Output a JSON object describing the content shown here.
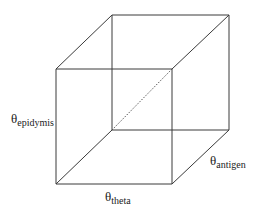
{
  "diagram": {
    "type": "cube",
    "line_color": "#3a3a3a",
    "vertices": {
      "front_top_left": [
        56,
        69
      ],
      "front_top_right": [
        172,
        69
      ],
      "front_bottom_left": [
        56,
        184
      ],
      "front_bottom_right": [
        172,
        184
      ],
      "back_top_left": [
        112,
        15
      ],
      "back_top_right": [
        229,
        15
      ],
      "back_bottom_left": [
        112,
        130
      ],
      "back_bottom_right": [
        229,
        130
      ]
    },
    "labels": {
      "vertical_axis": {
        "symbol": "θ",
        "subscript": "epidymis"
      },
      "depth_axis": {
        "symbol": "θ",
        "subscript": "antigen"
      },
      "horizontal_axis": {
        "symbol": "θ",
        "subscript": "theta"
      }
    }
  }
}
